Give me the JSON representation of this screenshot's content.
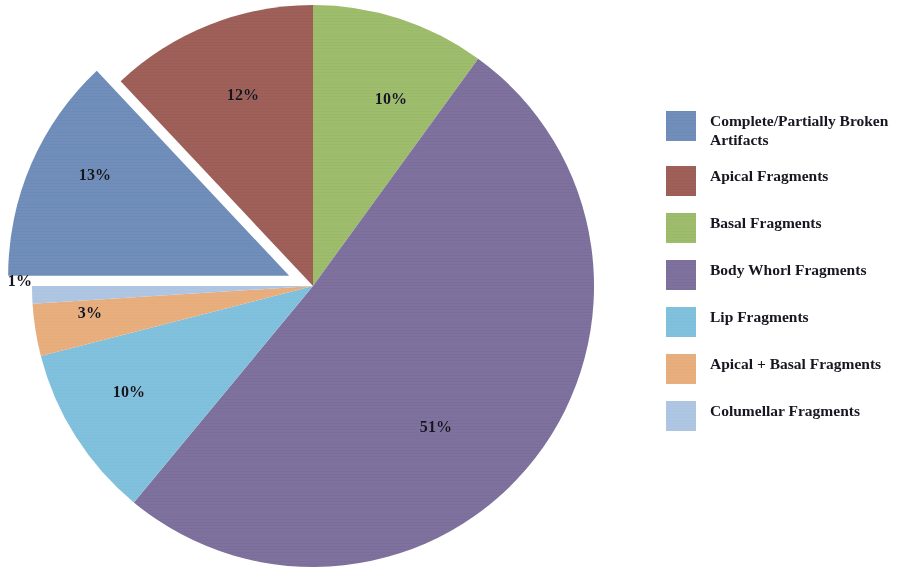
{
  "chart_data": {
    "type": "pie",
    "title": "",
    "subtitle": "",
    "xlabel": "",
    "ylabel": "",
    "legend_position": "right",
    "grid": false,
    "units": "percent",
    "start_angle_deg": 0,
    "direction": "clockwise",
    "exploded_slices": [
      "Complete/Partially Broken Artifacts"
    ],
    "categories": [
      "Complete/Partially Broken Artifacts",
      "Apical Fragments",
      "Basal Fragments",
      "Body Whorl Fragments",
      "Lip Fragments",
      "Apical + Basal Fragments",
      "Columellar Fragments"
    ],
    "values": [
      13,
      12,
      10,
      51,
      10,
      3,
      1
    ],
    "value_labels": [
      "13%",
      "12%",
      "10%",
      "51%",
      "10%",
      "3%",
      "1%"
    ],
    "colors": [
      "#6e8cb8",
      "#9c5e56",
      "#9cbb6a",
      "#7c6f9c",
      "#7fc0dc",
      "#e8ad7b",
      "#adc5e2"
    ]
  },
  "legend": {
    "items": [
      {
        "label": "Complete/Partially Broken Artifacts",
        "color": "#6e8cb8"
      },
      {
        "label": "Apical Fragments",
        "color": "#9c5e56"
      },
      {
        "label": "Basal Fragments",
        "color": "#9cbb6a"
      },
      {
        "label": "Body Whorl Fragments",
        "color": "#7c6f9c"
      },
      {
        "label": "Lip Fragments",
        "color": "#7fc0dc"
      },
      {
        "label": "Apical + Basal Fragments",
        "color": "#e8ad7b"
      },
      {
        "label": "Columellar Fragments",
        "color": "#adc5e2"
      }
    ]
  },
  "pie_labels": [
    {
      "text": "12%",
      "x": 243,
      "y": 95,
      "name": "pie-label-apical-fragments"
    },
    {
      "text": "10%",
      "x": 391,
      "y": 99,
      "name": "pie-label-basal-fragments"
    },
    {
      "text": "51%",
      "x": 436,
      "y": 427,
      "name": "pie-label-body-whorl-fragments"
    },
    {
      "text": "10%",
      "x": 129,
      "y": 392,
      "name": "pie-label-lip-fragments"
    },
    {
      "text": "3%",
      "x": 90,
      "y": 313,
      "name": "pie-label-apical-basal-fragments"
    },
    {
      "text": "1%",
      "x": 20,
      "y": 281,
      "name": "pie-label-columellar-fragments"
    },
    {
      "text": "13%",
      "x": 95,
      "y": 175,
      "name": "pie-label-complete-partially-broken"
    }
  ],
  "geometry": {
    "cx": 313,
    "cy": 286,
    "r": 281,
    "explode_offset": 26
  }
}
